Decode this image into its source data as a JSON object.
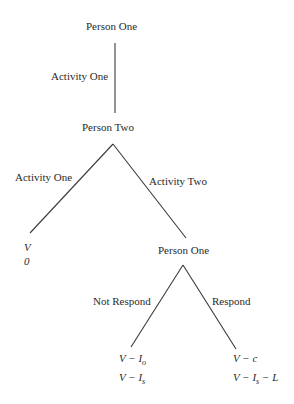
{
  "diagram": {
    "type": "game-tree",
    "nodes": {
      "root": {
        "label": "Person One"
      },
      "second": {
        "label": "Person Two"
      },
      "third": {
        "label": "Person One"
      }
    },
    "edges": {
      "root_to_second": {
        "label": "Activity One"
      },
      "second_left": {
        "label": "Activity One"
      },
      "second_right": {
        "label": "Activity Two"
      },
      "third_left": {
        "label": "Not Respond"
      },
      "third_right": {
        "label": "Respond"
      }
    },
    "payoffs": {
      "leaf1": {
        "p1": "V",
        "p2": "0"
      },
      "leaf2": {
        "p1_main": "V − I",
        "p1_sub": "o",
        "p2_main": "V − I",
        "p2_sub": "s"
      },
      "leaf3": {
        "p1": "V − c",
        "p2_main": "V − I",
        "p2_sub": "s",
        "p2_tail": " − L"
      }
    },
    "line_color": "#3a3a3a"
  }
}
